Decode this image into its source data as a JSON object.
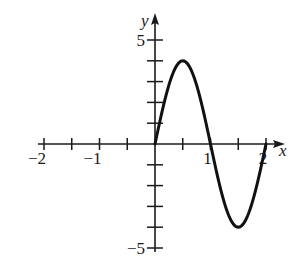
{
  "chart_data": {
    "type": "line",
    "title": "",
    "xlabel": "x",
    "ylabel": "y",
    "xlim": [
      -2,
      2
    ],
    "ylim": [
      -5,
      5
    ],
    "grid": false,
    "x_ticks": [
      -2,
      -1.5,
      -1,
      -0.5,
      0,
      0.5,
      1,
      1.5,
      2
    ],
    "x_tick_labels": [
      {
        "value": -2,
        "label": "−2"
      },
      {
        "value": -1,
        "label": "−1"
      },
      {
        "value": 1,
        "label": "1"
      },
      {
        "value": 2,
        "label": "2"
      }
    ],
    "y_ticks": [
      -5,
      -4,
      -3,
      -2,
      -1,
      1,
      2,
      3,
      4,
      5
    ],
    "y_tick_labels": [
      {
        "value": 5,
        "label": "5"
      },
      {
        "value": -5,
        "label": "−5"
      }
    ],
    "series": [
      {
        "name": "curve",
        "description": "one full period of a sine wave, amplitude 4, from x=0 to x=2",
        "x": [
          0,
          0.25,
          0.5,
          0.75,
          1,
          1.25,
          1.5,
          1.75,
          2
        ],
        "y": [
          0,
          2.83,
          4,
          2.83,
          0,
          -2.83,
          -4,
          -2.83,
          0
        ]
      }
    ],
    "colors": {
      "curve": "#111111",
      "axes": "#1a1a1a"
    }
  }
}
